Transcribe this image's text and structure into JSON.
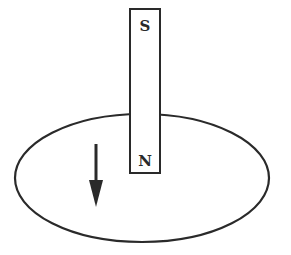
{
  "diagram": {
    "magnet": {
      "top_pole_label": "S",
      "bottom_pole_label": "N",
      "x": 130,
      "y": 9,
      "width": 30,
      "height": 164
    },
    "loop": {
      "cx": 142,
      "cy": 178,
      "rx": 127,
      "ry": 64
    },
    "arrow": {
      "direction": "down",
      "x": 96,
      "y_start": 144,
      "y_end": 206
    },
    "colors": {
      "stroke": "#2a2a2a",
      "background": "#ffffff"
    }
  }
}
